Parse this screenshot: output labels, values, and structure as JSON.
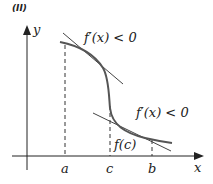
{
  "panel_label": "(II)",
  "axes": {
    "x_label": "x",
    "y_label": "y"
  },
  "ticks": {
    "a": "a",
    "c": "c",
    "b": "b"
  },
  "annotations": {
    "top": "f′(x) < 0",
    "bottom": "f′(x) < 0",
    "point": "f(c)"
  },
  "colors": {
    "curve": "#555555",
    "axes": "#222222"
  }
}
